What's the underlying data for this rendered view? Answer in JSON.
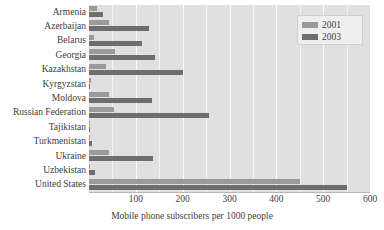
{
  "chart_data": {
    "type": "bar",
    "orientation": "horizontal",
    "title": "",
    "xlabel": "Mobile phone subscribers per 1000 people",
    "ylabel": "",
    "xlim": [
      0,
      600
    ],
    "xticks": [
      100,
      200,
      300,
      400,
      500,
      600
    ],
    "grid": true,
    "legend_position": "top-right",
    "categories": [
      "Armenia",
      "Azerbaijan",
      "Belarus",
      "Georgia",
      "Kazakhstan",
      "Kyrgyzstan",
      "Moldova",
      "Russian Federation",
      "Tajikistan",
      "Turkmenistan",
      "Ukraine",
      "Uzbekistan",
      "United States"
    ],
    "series": [
      {
        "name": "2001",
        "color": "#9a9a9a",
        "values": [
          18,
          42,
          10,
          55,
          36,
          4,
          42,
          53,
          1,
          2,
          43,
          3,
          450
        ]
      },
      {
        "name": "2003",
        "color": "#6e6e6e",
        "values": [
          30,
          128,
          113,
          140,
          200,
          2,
          135,
          256,
          3,
          7,
          136,
          13,
          550
        ]
      }
    ],
    "colors": {
      "plot_background": "#e0e0e0",
      "gridline": "#f6f6f6",
      "axis": "#b8b8b8",
      "text": "#3d3d3d",
      "legend_background": "#efefef",
      "legend_border": "#cfcfcf"
    }
  },
  "legend": {
    "items": [
      {
        "label": "2001",
        "swatch": "#9a9a9a"
      },
      {
        "label": "2003",
        "swatch": "#6e6e6e"
      }
    ]
  },
  "axis": {
    "x_title": "Mobile phone subscribers per 1000 people",
    "ticks": [
      "100",
      "200",
      "300",
      "400",
      "500",
      "600"
    ]
  }
}
